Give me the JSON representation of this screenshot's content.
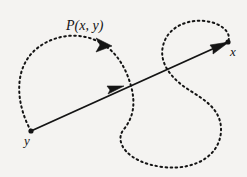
{
  "figure": {
    "kind": "geometry-diagram",
    "background_color": "#f4f3f1",
    "ink_color": "#141414",
    "width": 247,
    "height": 177,
    "labels": {
      "path_label": "P(x, y)",
      "endpoint_right": "x",
      "endpoint_left": "y"
    },
    "elements": {
      "dotted_path_name": "dotted-curve-path",
      "straight_arrow_name": "straight-arrow",
      "point_x_name": "endpoint-dot-x",
      "point_y_name": "endpoint-dot-y"
    },
    "geometry": {
      "point_y": [
        31,
        131
      ],
      "point_x": [
        228,
        42
      ],
      "dotted_arrow_at": [
        104,
        45
      ],
      "straight_arrow_at": [
        118,
        88
      ],
      "dash_pattern": "1.6 3.4",
      "stroke_width_dotted": 2.0,
      "stroke_width_solid": 1.9,
      "dot_radius": 2.6
    }
  }
}
